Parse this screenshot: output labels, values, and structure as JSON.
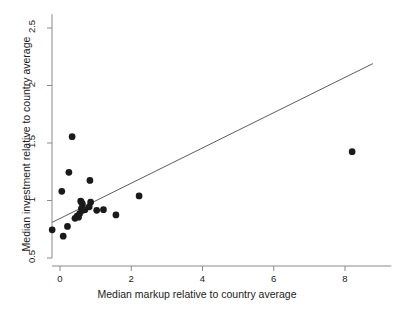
{
  "chart_data": {
    "type": "scatter",
    "title": "",
    "xlabel": "Median markup relative to country average",
    "ylabel": "Median investment relative to country average",
    "xlim": [
      -0.45,
      9.3
    ],
    "ylim": [
      0.45,
      2.62
    ],
    "xticks": [
      0,
      2,
      4,
      6,
      8
    ],
    "xtick_labels": [
      "0",
      "2",
      "4",
      "6",
      "8"
    ],
    "yticks": [
      0.5,
      1,
      1.5,
      2,
      2.5
    ],
    "ytick_labels": [
      "0.5",
      "1",
      "1.5",
      "2",
      "2.5"
    ],
    "grid": false,
    "legend": "none",
    "marker_color": "#1a1a1a",
    "marker_size": 5.2,
    "line_color": "#4a4a4a",
    "axis_color": "#8a8a8a",
    "points": [
      {
        "x": -0.22,
        "y": 0.745
      },
      {
        "x": 0.05,
        "y": 1.08
      },
      {
        "x": 0.09,
        "y": 0.69
      },
      {
        "x": 0.21,
        "y": 0.775
      },
      {
        "x": 0.25,
        "y": 1.245
      },
      {
        "x": 0.34,
        "y": 1.555
      },
      {
        "x": 0.42,
        "y": 0.845
      },
      {
        "x": 0.48,
        "y": 0.865
      },
      {
        "x": 0.52,
        "y": 0.855
      },
      {
        "x": 0.55,
        "y": 0.885
      },
      {
        "x": 0.58,
        "y": 0.995
      },
      {
        "x": 0.6,
        "y": 0.985
      },
      {
        "x": 0.63,
        "y": 0.97
      },
      {
        "x": 0.6,
        "y": 0.93
      },
      {
        "x": 0.64,
        "y": 0.915
      },
      {
        "x": 0.7,
        "y": 0.92
      },
      {
        "x": 0.84,
        "y": 1.175
      },
      {
        "x": 0.86,
        "y": 0.985
      },
      {
        "x": 0.82,
        "y": 0.945
      },
      {
        "x": 1.03,
        "y": 0.915
      },
      {
        "x": 1.22,
        "y": 0.92
      },
      {
        "x": 1.57,
        "y": 0.875
      },
      {
        "x": 2.22,
        "y": 1.04
      },
      {
        "x": 8.2,
        "y": 1.425
      }
    ],
    "fit_line": {
      "name": "linear fit",
      "x_start": -0.22,
      "y_start": 0.81,
      "x_end": 8.78,
      "y_end": 2.19
    }
  }
}
